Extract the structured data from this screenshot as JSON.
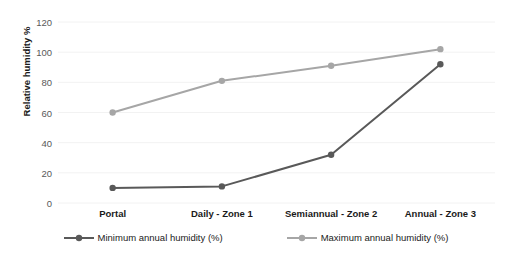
{
  "chart_data": {
    "type": "line",
    "title": "",
    "xlabel": "",
    "ylabel": "Relative humidity %",
    "categories": [
      "Portal",
      "Daily - Zone 1",
      "Semiannual - Zone 2",
      "Annual - Zone 3"
    ],
    "series": [
      {
        "name": "Minimum annual humidity (%)",
        "color": "#595959",
        "values": [
          10,
          11,
          32,
          92
        ]
      },
      {
        "name": "Maximum annual humidity (%)",
        "color": "#a6a6a6",
        "values": [
          60,
          81,
          91,
          102
        ]
      }
    ],
    "ylim": [
      0,
      120
    ],
    "yticks": [
      0,
      20,
      40,
      60,
      80,
      100,
      120
    ],
    "ytick_labels": [
      "0",
      "20",
      "40",
      "60",
      "80",
      "100",
      "120"
    ],
    "grid": true,
    "grid_color": "#f2f2f2",
    "legend_position": "bottom"
  },
  "legend": {
    "items": [
      {
        "label": "Minimum annual humidity (%)"
      },
      {
        "label": "Maximum annual humidity (%)"
      }
    ]
  },
  "axis": {
    "y_title": "Relative humidity %"
  }
}
